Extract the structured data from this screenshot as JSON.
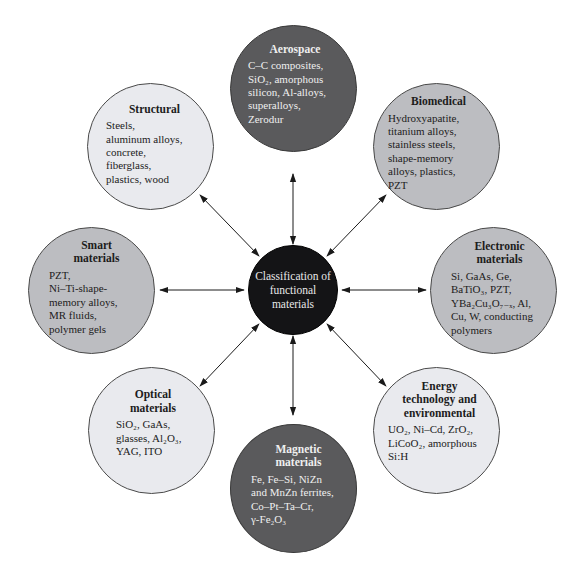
{
  "center": {
    "lines": [
      "Classification of",
      "functional",
      "materials"
    ],
    "fill": "#141416"
  },
  "categories": [
    {
      "id": "aerospace",
      "title": "Aerospace",
      "shade": "dark",
      "lines": [
        "C–C composites,",
        "SiO₂, amorphous",
        "silicon, Al-alloys,",
        "superalloys,",
        "Zerodur"
      ]
    },
    {
      "id": "structural",
      "title": "Structural",
      "shade": "light",
      "lines": [
        "Steels,",
        "aluminum alloys,",
        "concrete,",
        "fiberglass,",
        "plastics, wood"
      ]
    },
    {
      "id": "biomedical",
      "title": "Biomedical",
      "shade": "mid",
      "lines": [
        "Hydroxyapatite,",
        "titanium alloys,",
        "stainless steels,",
        "shape-memory",
        "alloys, plastics,",
        "PZT"
      ]
    },
    {
      "id": "smart",
      "title": "Smart materials",
      "title_lines": [
        "Smart",
        "materials"
      ],
      "shade": "mid",
      "lines": [
        "PZT,",
        "Ni–Ti-shape-",
        "memory alloys,",
        "MR fluids,",
        "polymer gels"
      ]
    },
    {
      "id": "electronic",
      "title": "Electronic materials",
      "title_lines": [
        "Electronic",
        "materials"
      ],
      "shade": "mid",
      "lines": [
        "Si, GaAs, Ge,",
        "BaTiO₃, PZT,",
        "YBa₂Cu₃O₇₋ₓ, Al,",
        "Cu, W, conducting",
        "polymers"
      ]
    },
    {
      "id": "optical",
      "title": "Optical materials",
      "title_lines": [
        "Optical",
        "materials"
      ],
      "shade": "light",
      "lines": [
        "SiO₂, GaAs,",
        "glasses, Al₂O₃,",
        "YAG, ITO"
      ]
    },
    {
      "id": "energy",
      "title": "Energy technology and environmental",
      "title_lines": [
        "Energy",
        "technology and",
        "environmental"
      ],
      "shade": "light",
      "lines": [
        "UO₂, Ni–Cd, ZrO₂,",
        "LiCoO₂, amorphous",
        "Si:H"
      ]
    },
    {
      "id": "magnetic",
      "title": "Magnetic materials",
      "title_lines": [
        "Magnetic",
        "materials"
      ],
      "shade": "dark",
      "lines": [
        "Fe, Fe–Si, NiZn",
        "and MnZn ferrites,",
        "Co–Pt–Ta–Cr,",
        "γ-Fe₂O₃"
      ]
    }
  ],
  "colors": {
    "light": "#e9eaee",
    "mid": "#bcbdc1",
    "dark": "#5a5a5c",
    "arrow": "#1a1a1a"
  }
}
